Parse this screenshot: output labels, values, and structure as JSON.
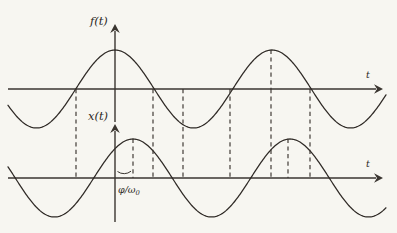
{
  "figure": {
    "background_color": "#f7f6f1",
    "ink_color": "#3a3530",
    "labels": {
      "top_signal": "f(t)",
      "bottom_signal": "x(t)",
      "top_time_axis": "t",
      "bottom_time_axis": "t",
      "phase_delay": "φ/ω",
      "phase_delay_subscript": "0",
      "phase_delay_full": "φ/ω₀"
    }
  },
  "chart_data": {
    "type": "line",
    "xlabel": "t",
    "ylabel": "",
    "grid": false,
    "legend": "none",
    "axes": [
      {
        "name": "top-axis",
        "signal_label": "f(t)",
        "origin_px": {
          "x": 115,
          "y": 89
        },
        "time_axis_y_px": 89,
        "axis_x_start_px": 8,
        "axis_x_end_px": 382,
        "vertical_axis_top_px": 26,
        "amplitude_px": 39,
        "period_px": 157,
        "peaks_px": [
          115,
          272
        ],
        "troughs_px": [
          193
        ],
        "zero_crossings_px": [
          76,
          153,
          230,
          310
        ]
      },
      {
        "name": "bottom-axis",
        "signal_label": "x(t)",
        "origin_px": {
          "x": 115,
          "y": 178
        },
        "time_axis_y_px": 178,
        "axis_x_start_px": 8,
        "axis_x_end_px": 382,
        "vertical_axis_top_px": 124,
        "amplitude_px": 39,
        "period_px": 157,
        "phase_shift_px": 18,
        "peaks_px": [
          133,
          290
        ],
        "troughs_px": [
          211
        ],
        "zero_crossings_px": [
          94,
          172,
          251,
          329
        ]
      }
    ],
    "series": [
      {
        "name": "f(t)",
        "form": "cosine",
        "amplitude": 1,
        "period": 157,
        "phase_offset_px": 0,
        "description": "Reference cosine centred on the vertical axis; maximum at t = 0."
      },
      {
        "name": "x(t)",
        "form": "cosine",
        "amplitude": 1,
        "period": 157,
        "phase_offset_px": 18,
        "description": "Identical cosine delayed by φ/ω₀; maximum occurs 18 px after t = 0."
      }
    ],
    "dashed_markers_px": [
      76,
      133,
      153,
      183,
      230,
      271,
      290,
      310
    ],
    "dashed_markers_spanning_both": [
      76,
      153,
      183,
      230,
      271,
      310
    ],
    "dashed_markers_bottom_only": [
      133,
      290
    ],
    "annotations": [
      {
        "name": "phase-delay-arc",
        "text": "φ/ω₀",
        "from_px": 115,
        "to_px": 133,
        "at_y_px": 178,
        "meaning": "time delay between f(t) and x(t)"
      }
    ]
  }
}
